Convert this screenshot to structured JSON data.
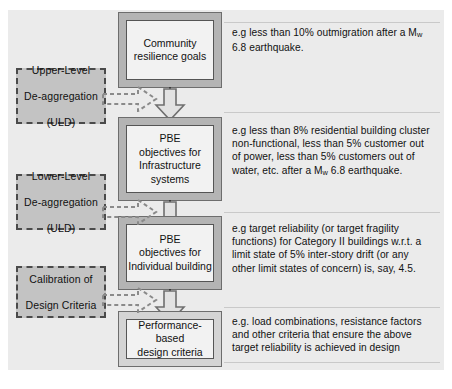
{
  "diagram": {
    "colors": {
      "panel_background": "#ebebeb",
      "stage_frame": "#b4b4b4",
      "stage_inner": "#f2f2f2",
      "dashed_box_fill": "#c3c3c3",
      "outline": "#555555",
      "text": "#111111"
    },
    "stages": [
      {
        "id": "community-resilience-goals",
        "label_lines": [
          "Community",
          "resilience goals"
        ],
        "note_lines": [
          "e.g less than 10% outmigration after a M",
          "6.8 earthquake."
        ],
        "note_sub": "w"
      },
      {
        "id": "pbe-objectives-infrastructure-systems",
        "label_lines": [
          "PBE",
          "objectives for",
          "Infrastructure",
          "systems"
        ],
        "note_lines": [
          "e.g less than 8%  residential building cluster",
          "non-functional, less than 5% customer out",
          "of power, less than 5% customers out of",
          "water, etc. after a M"
        ],
        "note_sub": "w",
        "note_tail": " 6.8 earthquake."
      },
      {
        "id": "pbe-objectives-individual-building",
        "label_lines": [
          "PBE",
          "objectives for",
          "Individual building"
        ],
        "note_lines": [
          "e.g target reliability (or target fragility",
          "functions) for Category II buildings w.r.t. a",
          "limit state of 5% inter-story drift (or any",
          "other limit states of concern) is, say, 4.5."
        ]
      },
      {
        "id": "performance-based-design-criteria",
        "label_lines": [
          "Performance-based",
          "design criteria"
        ],
        "note_lines": [
          "e.g. load combinations, resistance factors",
          "and other criteria that ensure the above",
          "target reliability is achieved in design"
        ]
      }
    ],
    "deaggregations": [
      {
        "id": "upper-level-de-aggregation",
        "label_lines": [
          "Upper-Level",
          "De-aggregation",
          "(ULD)"
        ]
      },
      {
        "id": "lower-level-de-aggregation",
        "label_lines": [
          "Lower-Level",
          "De-aggregation",
          "(ULD)"
        ]
      },
      {
        "id": "calibration-of-design-criteria",
        "label_lines": [
          "Calibration of",
          "Design Criteria"
        ]
      }
    ]
  }
}
